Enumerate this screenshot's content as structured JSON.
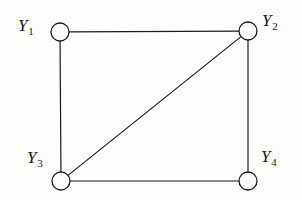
{
  "figure": {
    "type": "undirected-graph-diagram",
    "background_color": "#fdfdfc",
    "stroke_color": "#1b1b1b",
    "width": 302,
    "height": 200
  },
  "nodes": [
    {
      "id": "Y1",
      "base": "Y",
      "subscript": "1",
      "cx": 60,
      "cy": 32,
      "r": 9,
      "label_position": "left"
    },
    {
      "id": "Y2",
      "base": "Y",
      "subscript": "2",
      "cx": 248,
      "cy": 31,
      "r": 9,
      "label_position": "right"
    },
    {
      "id": "Y3",
      "base": "Y",
      "subscript": "3",
      "cx": 61,
      "cy": 181,
      "r": 9,
      "label_position": "top-left"
    },
    {
      "id": "Y4",
      "base": "Y",
      "subscript": "4",
      "cx": 248,
      "cy": 181,
      "r": 9,
      "label_position": "top-right"
    }
  ],
  "edges": [
    {
      "id": "e-y1-y2",
      "from": "Y1",
      "to": "Y2",
      "kind": "top"
    },
    {
      "id": "e-y1-y3",
      "from": "Y1",
      "to": "Y3",
      "kind": "left"
    },
    {
      "id": "e-y3-y2",
      "from": "Y3",
      "to": "Y2",
      "kind": "diagonal"
    },
    {
      "id": "e-y2-y4",
      "from": "Y2",
      "to": "Y4",
      "kind": "right"
    },
    {
      "id": "e-y3-y4",
      "from": "Y3",
      "to": "Y4",
      "kind": "bottom"
    }
  ]
}
